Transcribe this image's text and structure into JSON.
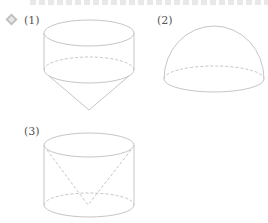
{
  "problem": {
    "number_marker": "4",
    "marker_color": "#b9b9b9",
    "line_color": "#c8c8c8",
    "dash_color": "#cfcfcf"
  },
  "figures": [
    {
      "label": "(1)",
      "description": "cylinder on top of inverted cone"
    },
    {
      "label": "(2)",
      "description": "hemisphere"
    },
    {
      "label": "(3)",
      "description": "cylinder with inverted cone inside"
    }
  ]
}
